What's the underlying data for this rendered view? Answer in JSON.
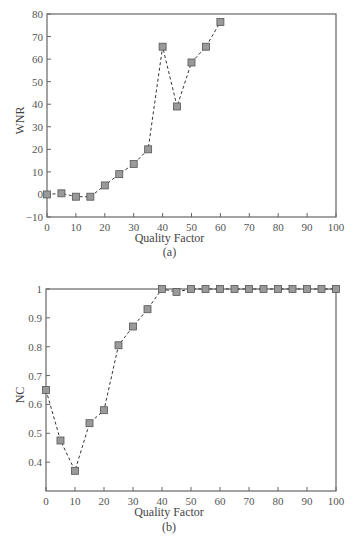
{
  "chart_data": [
    {
      "id": "a",
      "type": "line",
      "caption": "(a)",
      "title": "",
      "xlabel": "Quality Factor",
      "ylabel": "WNR",
      "xlim": [
        0,
        100
      ],
      "ylim": [
        -10,
        80
      ],
      "xticks": [
        0,
        10,
        20,
        30,
        40,
        50,
        60,
        70,
        80,
        90,
        100
      ],
      "yticks": [
        -10,
        0,
        10,
        20,
        30,
        40,
        50,
        60,
        70,
        80
      ],
      "ytick_labels": [
        "−10",
        "0",
        "10",
        "20",
        "30",
        "40",
        "50",
        "60",
        "70",
        "80"
      ],
      "grid": false,
      "legend": null,
      "series": [
        {
          "name": "WNR",
          "line_style": "dashed",
          "marker": "square",
          "marker_color": "#9a9a9a",
          "x": [
            0,
            5,
            10,
            15,
            20,
            25,
            30,
            35,
            40,
            45,
            50,
            55,
            60
          ],
          "values": [
            0,
            0.5,
            -1,
            -1,
            4,
            9,
            13.5,
            20,
            65.5,
            39,
            58.5,
            65.5,
            76.5
          ]
        }
      ]
    },
    {
      "id": "b",
      "type": "line",
      "caption": "(b)",
      "title": "",
      "xlabel": "Quality Factor",
      "ylabel": "NC",
      "xlim": [
        0,
        100
      ],
      "ylim": [
        0.3,
        1.0
      ],
      "xticks": [
        0,
        10,
        20,
        30,
        40,
        50,
        60,
        70,
        80,
        90,
        100
      ],
      "yticks": [
        0.4,
        0.5,
        0.6,
        0.7,
        0.8,
        0.9,
        1.0
      ],
      "ytick_labels": [
        "0.4",
        "0.5",
        "0.6",
        "0.7",
        "0.8",
        "0.9",
        "1"
      ],
      "grid": false,
      "legend": null,
      "series": [
        {
          "name": "NC",
          "line_style": "dashed",
          "marker": "square",
          "marker_color": "#9a9a9a",
          "x": [
            0,
            5,
            10,
            15,
            20,
            25,
            30,
            35,
            40,
            45,
            50,
            55,
            60,
            65,
            70,
            75,
            80,
            85,
            90,
            95,
            100
          ],
          "values": [
            0.65,
            0.475,
            0.37,
            0.535,
            0.58,
            0.805,
            0.87,
            0.93,
            1.0,
            0.99,
            1.0,
            1.0,
            1.0,
            1.0,
            1.0,
            1.0,
            1.0,
            1.0,
            1.0,
            1.0,
            1.0
          ]
        }
      ]
    }
  ],
  "colors": {
    "axis": "#666666",
    "line": "#333333",
    "marker_fill": "#9a9a9a",
    "marker_stroke": "#555555",
    "text": "#444444"
  }
}
